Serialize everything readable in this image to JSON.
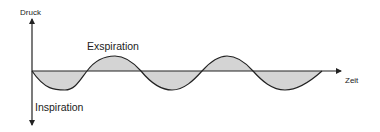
{
  "axes": {
    "y_label": "Druck",
    "x_label": "Zeit"
  },
  "annotations": {
    "above_baseline": "Exspiration",
    "below_baseline": "Inspiration"
  },
  "colors": {
    "line": "#222222",
    "fill": "#d4d4d4",
    "background": "#ffffff"
  },
  "waveform": {
    "type": "sinusoid",
    "description": "Pressure over time during breathing: negative lobes = inspiration, positive lobes = expiration",
    "lobes": [
      "negative",
      "positive",
      "negative",
      "positive",
      "negative"
    ]
  }
}
